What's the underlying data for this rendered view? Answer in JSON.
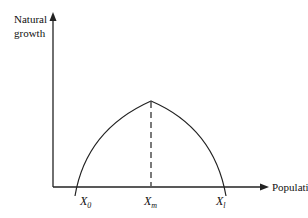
{
  "diagram": {
    "type": "parabola-growth-curve",
    "y_axis_label_line1": "Natural",
    "y_axis_label_line2": "growth",
    "x_axis_label": "Population",
    "points": [
      {
        "name": "X",
        "sub": "0"
      },
      {
        "name": "X",
        "sub": "m"
      },
      {
        "name": "X",
        "sub": "l"
      }
    ],
    "colors": {
      "line": "#222222",
      "background": "#ffffff"
    }
  }
}
